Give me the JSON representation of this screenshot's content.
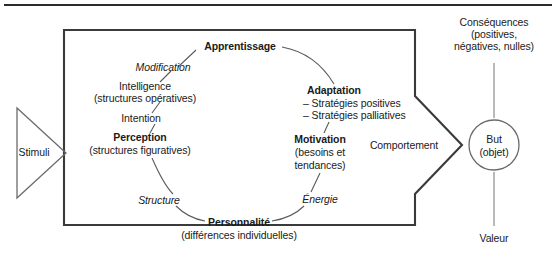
{
  "diagram": {
    "title_visible": false,
    "colors": {
      "stroke": "#3a3a3a",
      "text": "#1a1a1a",
      "background": "#ffffff",
      "top_rule": "#2b2b2b"
    },
    "input": {
      "stimuli_label": "Stimuli"
    },
    "inside_box": {
      "apprentissage": "Apprentissage",
      "modification": "Modification",
      "intelligence": "Intelligence",
      "intelligence_sub": "(structures opératives)",
      "intention": "Intention",
      "perception": "Perception",
      "perception_sub": "(structures figuratives)",
      "adaptation": "Adaptation",
      "adaptation_items": [
        "– Stratégies positives",
        "– Stratégies palliatives"
      ],
      "motivation": "Motivation",
      "motivation_sub_line1": "(besoins et",
      "motivation_sub_line2": "tendances)",
      "structure": "Structure",
      "energie": "Énergie",
      "personnalite": "Personnalité",
      "personnalite_sub": "(différences individuelles)"
    },
    "output": {
      "comportement": "Comportement",
      "consequences_line1": "Conséquences",
      "consequences_line2": "(positives,",
      "consequences_line3": "négatives, nulles)",
      "but_line1": "But",
      "but_line2": "(objet)",
      "valeur": "Valeur"
    }
  }
}
